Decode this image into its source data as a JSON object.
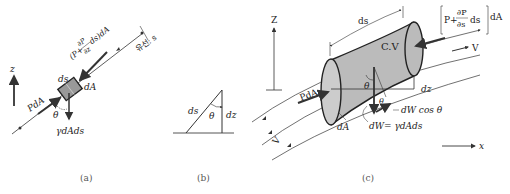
{
  "panel_a": {
    "caption": "(a)",
    "z_axis": "z",
    "ds": "ds",
    "dA": "dA",
    "PdA": "PdA",
    "theta": "θ",
    "weight": "γdAds",
    "upstream_force_1": "(P+",
    "upstream_force_num": "∂P",
    "upstream_force_den": "∂z",
    "upstream_force_2": "ds)dA",
    "streamline": "유선: s"
  },
  "panel_b": {
    "caption": "(b)",
    "ds": "ds",
    "theta": "θ",
    "dz": "dz"
  },
  "panel_c": {
    "caption": "(c)",
    "z_axis": "Z",
    "x_axis": "x",
    "ds": "ds",
    "cv": "C.V",
    "force_open": "P+",
    "force_num": "∂P",
    "force_den": "∂s",
    "force_ds": "ds",
    "force_dA": "dA",
    "V_top": "V",
    "V_bottom": "V",
    "PdA": "PdA",
    "theta_1": "θ",
    "theta_2": "θ",
    "dz": "dz",
    "dA": "dA",
    "dWcos": "dW cos θ",
    "dW": "dW= γdAds"
  }
}
